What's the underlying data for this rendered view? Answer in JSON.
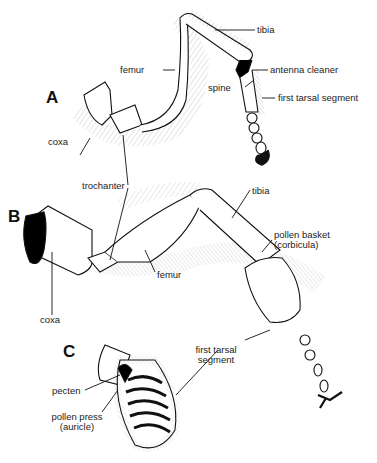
{
  "figure": {
    "panels": [
      {
        "id": "A",
        "letter": "A",
        "labels": {
          "tibia": "tibia",
          "femur": "femur",
          "antenna_cleaner": "antenna cleaner",
          "spine": "spine",
          "first_tarsal_segment": "first tarsal segment",
          "coxa": "coxa"
        }
      },
      {
        "id": "B",
        "letter": "B",
        "labels": {
          "trochanter": "trochanter",
          "tibia": "tibia",
          "pollen_basket_1": "pollen basket",
          "pollen_basket_2": "(corbicula)",
          "femur": "femur",
          "coxa": "coxa",
          "first_tarsal_1": "first tarsal",
          "first_tarsal_2": "segment"
        }
      },
      {
        "id": "C",
        "letter": "C",
        "labels": {
          "pecten": "pecten",
          "pollen_press_1": "pollen press",
          "pollen_press_2": "(auricle)"
        }
      }
    ]
  }
}
